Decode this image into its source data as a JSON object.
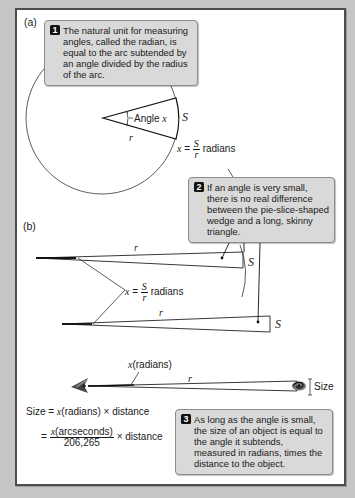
{
  "panel_labels": {
    "a": "(a)",
    "b": "(b)"
  },
  "callouts": [
    {
      "number": "1",
      "text": "The natural unit for measuring angles, called the radian, is equal to the arc subtended by an angle divided by the radius of the arc."
    },
    {
      "number": "2",
      "text": "If an angle is very small, there is no real difference between the pie-slice-shaped wedge and a long, skinny triangle."
    },
    {
      "number": "3",
      "text": "As long as the angle is small, the size of an object is equal to the angle it subtends, measured in radians, times the distance to the object."
    }
  ],
  "part_a": {
    "angle_label_prefix": "Angle ",
    "angle_var": "x",
    "arc_label": "S",
    "radius_label": "r",
    "formula": {
      "lhs": "x",
      "eq": " = ",
      "num": "S",
      "den": "r",
      "unit": " radians"
    }
  },
  "part_b": {
    "radius_label_top": "r",
    "radius_label_bottom": "r",
    "arc_label_top": "S",
    "arc_label_bottom": "S",
    "formula": {
      "lhs": "x",
      "eq": " = ",
      "num": "S",
      "den": "r",
      "unit": " radians"
    }
  },
  "part_c": {
    "angle_label_var": "x",
    "angle_label_unit": "(radians)",
    "radius_label": "r",
    "size_label": "Size",
    "eq1": {
      "lhs": "Size = ",
      "var": "x",
      "rest": "(radians) × distance"
    },
    "eq2": {
      "eq": "= ",
      "num_var": "x",
      "num_rest": "(arcseconds)",
      "den": "206,265",
      "rest": " × distance"
    }
  },
  "colors": {
    "background": "#c6c6c6",
    "panel": "#ffffff",
    "panel_border": "#4d4d4d",
    "callout_bg": "#d9d9d9",
    "callout_border": "#8c8c8c",
    "badge": "#111111",
    "line": "#1a1a1a"
  }
}
